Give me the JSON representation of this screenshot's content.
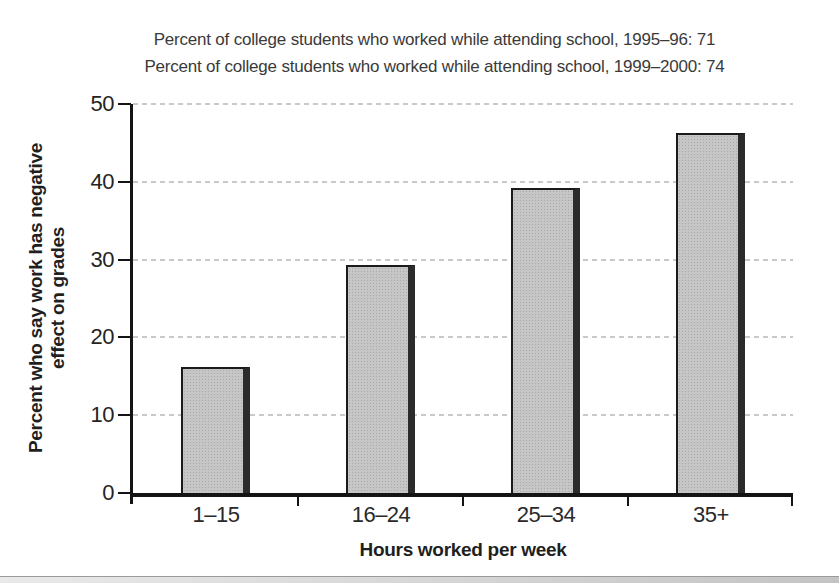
{
  "figure": {
    "title_line1": "Percent of college students who worked while attending school, 1995–96: 71",
    "title_line2": "Percent of college students who worked while attending school, 1999–2000: 74"
  },
  "chart_data": {
    "type": "bar",
    "categories": [
      "1–15",
      "16–24",
      "25–34",
      "35+"
    ],
    "values": [
      16,
      29,
      39,
      46
    ],
    "title": "",
    "xlabel": "Hours worked per week",
    "ylabel": "Percent who say work has negative effect on grades",
    "ylabel_lines": [
      "Percent who say work has negative",
      "effect on grades"
    ],
    "ylim": [
      0,
      50
    ],
    "yticks": [
      0,
      10,
      20,
      30,
      40,
      50
    ],
    "grid": "horizontal-dashed",
    "legend": "none",
    "annotations": [
      "Percent of college students who worked while attending school, 1995–96: 71",
      "Percent of college students who worked while attending school, 1999–2000: 74"
    ],
    "colors": {
      "bar_fill": "#c6c6c6",
      "bar_shadow": "#2b2b2b",
      "bar_border": "#1a1a1a",
      "axis": "#141414",
      "gridline": "#c9c9c9",
      "text": "#2a2a2a",
      "page_edge_band": "#cccccc"
    }
  }
}
